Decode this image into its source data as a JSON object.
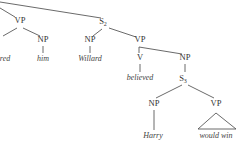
{
  "tree": {
    "nodes": [
      {
        "id": "vp1",
        "label": "VP",
        "x": 20,
        "y": 23
      },
      {
        "id": "np_him",
        "label": "NP",
        "x": 43,
        "y": 42
      },
      {
        "id": "s2",
        "label": "S",
        "sub": "2",
        "x": 105,
        "y": 24
      },
      {
        "id": "np_willard",
        "label": "NP",
        "x": 90,
        "y": 42
      },
      {
        "id": "vp2",
        "label": "VP",
        "x": 140,
        "y": 42
      },
      {
        "id": "v",
        "label": "V",
        "x": 140,
        "y": 60
      },
      {
        "id": "np_s3",
        "label": "NP",
        "x": 185,
        "y": 60
      },
      {
        "id": "s3",
        "label": "S",
        "sub": "3",
        "x": 185,
        "y": 80
      },
      {
        "id": "np_harry",
        "label": "NP",
        "x": 154,
        "y": 106
      },
      {
        "id": "vp3",
        "label": "VP",
        "x": 216,
        "y": 106
      }
    ],
    "words": [
      {
        "id": "w_red",
        "text": "red",
        "x": 5,
        "y": 61
      },
      {
        "id": "w_him",
        "text": "him",
        "x": 43,
        "y": 61
      },
      {
        "id": "w_willard",
        "text": "Willard",
        "x": 90,
        "y": 61
      },
      {
        "id": "w_believed",
        "text": "believed",
        "x": 140,
        "y": 80
      },
      {
        "id": "w_harry",
        "text": "Harry",
        "x": 153,
        "y": 138
      },
      {
        "id": "w_wouldwin",
        "text": "would win",
        "x": 216,
        "y": 138
      }
    ]
  }
}
